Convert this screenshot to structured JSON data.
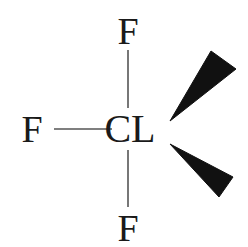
{
  "diagram": {
    "type": "chemical-structure",
    "background_color": "#ffffff",
    "bond_color": "#555555",
    "wedge_color": "#111111",
    "label_color": "#1a1a1a",
    "center_atom": {
      "symbol": "CL",
      "x": 130,
      "y": 128
    },
    "substituents": [
      {
        "symbol": "F",
        "position": "top",
        "x": 128,
        "y": 30
      },
      {
        "symbol": "F",
        "position": "left",
        "x": 32,
        "y": 128
      },
      {
        "symbol": "F",
        "position": "bottom",
        "x": 128,
        "y": 227
      }
    ],
    "bonds": [
      {
        "name": "bond-top",
        "style": "plain-line",
        "x1": 128,
        "y1": 50,
        "x2": 128,
        "y2": 108
      },
      {
        "name": "bond-bottom",
        "style": "plain-line",
        "x1": 128,
        "y1": 150,
        "x2": 128,
        "y2": 207
      },
      {
        "name": "bond-left",
        "style": "plain-line",
        "x1": 54,
        "y1": 129,
        "x2": 112,
        "y2": 129
      }
    ],
    "wedges": [
      {
        "name": "wedge-upper-right",
        "style": "solid-wedge",
        "tip": [
          170,
          121
        ],
        "wide_a": [
          211,
          51
        ],
        "wide_b": [
          236,
          69
        ]
      },
      {
        "name": "wedge-lower-right",
        "style": "solid-wedge",
        "tip": [
          170,
          144
        ],
        "wide_a": [
          233,
          177
        ],
        "wide_b": [
          219,
          197
        ]
      }
    ]
  }
}
